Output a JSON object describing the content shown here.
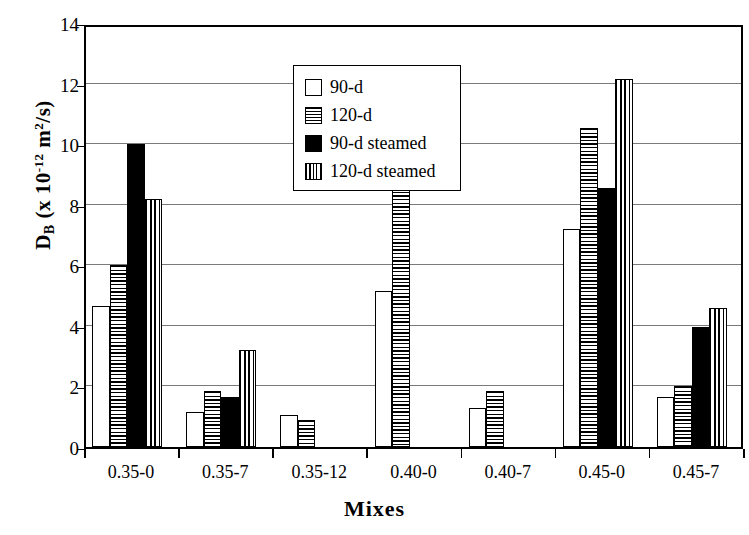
{
  "chart_data": {
    "type": "bar",
    "title": "",
    "xlabel": "Mixes",
    "ylabel": "D_B (x 10^-12 m^2/s)",
    "ylabel_parts": {
      "main": "D",
      "sub": "B",
      "open": " (x 10",
      "exp": "-12",
      "tail": " m",
      "exp2": "2",
      "tail2": "/s)"
    },
    "categories": [
      "0.35-0",
      "0.35-7",
      "0.35-12",
      "0.40-0",
      "0.40-7",
      "0.45-0",
      "0.45-7"
    ],
    "series": [
      {
        "name": "90-d",
        "pattern": "empty",
        "values": [
          4.65,
          1.15,
          1.05,
          5.15,
          1.3,
          7.2,
          1.65
        ]
      },
      {
        "name": "120-d",
        "pattern": "horizontal-hatch",
        "values": [
          6.0,
          1.85,
          0.9,
          9.4,
          1.85,
          10.55,
          2.0
        ]
      },
      {
        "name": "90-d steamed",
        "pattern": "solid-black",
        "values": [
          10.0,
          1.65,
          0,
          0,
          0,
          8.55,
          3.95
        ]
      },
      {
        "name": "120-d steamed",
        "pattern": "vertical-hatch",
        "values": [
          8.2,
          3.2,
          0,
          0,
          0,
          12.15,
          4.6
        ]
      }
    ],
    "ylim": [
      0,
      14
    ],
    "yticks": [
      0,
      2,
      4,
      6,
      8,
      10,
      12,
      14
    ],
    "ytick_labels": [
      "0",
      "2",
      "4",
      "6",
      "8",
      "10",
      "12",
      "14"
    ],
    "grid": true,
    "legend_position": "top-left-inside"
  }
}
